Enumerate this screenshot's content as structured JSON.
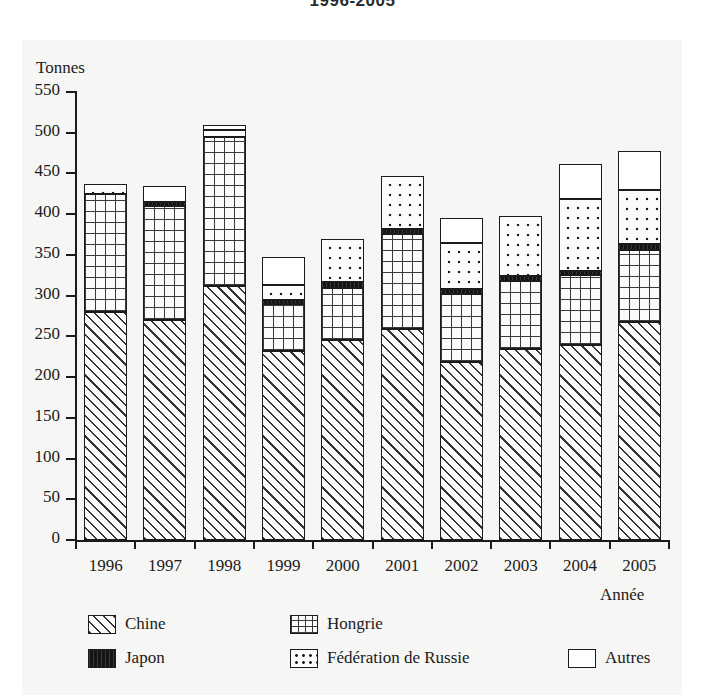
{
  "title": "1996-2005",
  "axes": {
    "y_unit_label": "Tonnes",
    "x_label": "Année",
    "y_ticks": [
      "0",
      "50",
      "100",
      "150",
      "200",
      "250",
      "300",
      "350",
      "400",
      "450",
      "500",
      "550"
    ],
    "x_ticks": [
      "1996",
      "1997",
      "1998",
      "1999",
      "2000",
      "2001",
      "2002",
      "2003",
      "2004",
      "2005"
    ]
  },
  "legend": {
    "items": [
      {
        "key": "chine",
        "label": "Chine",
        "pattern": "diagonal-hatch"
      },
      {
        "key": "hongrie",
        "label": "Hongrie",
        "pattern": "grid"
      },
      {
        "key": "japon",
        "label": "Japon",
        "pattern": "solid-black"
      },
      {
        "key": "russie",
        "label": "Fédération de Russie",
        "pattern": "dots"
      },
      {
        "key": "autres",
        "label": "Autres",
        "pattern": "white"
      }
    ]
  },
  "chart_data": {
    "type": "bar",
    "stacked": true,
    "title": "1996-2005",
    "xlabel": "Année",
    "ylabel": "Tonnes",
    "ylim": [
      0,
      550
    ],
    "ytick_step": 50,
    "grid": false,
    "legend_position": "bottom",
    "categories": [
      "1996",
      "1997",
      "1998",
      "1999",
      "2000",
      "2001",
      "2002",
      "2003",
      "2004",
      "2005"
    ],
    "series": [
      {
        "name": "Chine",
        "values": [
          280,
          270,
          312,
          232,
          246,
          259,
          219,
          234,
          240,
          268
        ]
      },
      {
        "name": "Hongrie",
        "values": [
          145,
          140,
          183,
          58,
          63,
          117,
          83,
          84,
          85,
          88
        ]
      },
      {
        "name": "Japon",
        "values": [
          0,
          5,
          0,
          5,
          8,
          6,
          6,
          6,
          5,
          7
        ]
      },
      {
        "name": "Fédération de Russie",
        "values": [
          12,
          0,
          8,
          18,
          52,
          65,
          57,
          74,
          89,
          67
        ]
      },
      {
        "name": "Autres",
        "values": [
          0,
          20,
          6,
          35,
          0,
          0,
          30,
          0,
          43,
          48
        ]
      }
    ],
    "totals": [
      437,
      435,
      509,
      348,
      369,
      447,
      395,
      398,
      462,
      478
    ]
  }
}
